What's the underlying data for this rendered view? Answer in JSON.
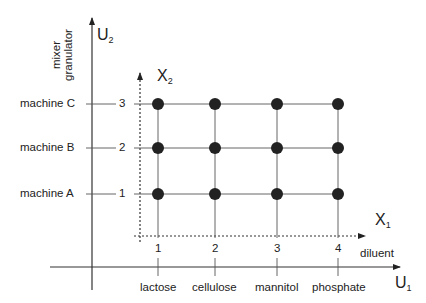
{
  "axes": {
    "u1": {
      "name": "U",
      "sub": "1"
    },
    "u2": {
      "name": "U",
      "sub": "2"
    },
    "x1": {
      "name": "X",
      "sub": "1"
    },
    "x2": {
      "name": "X",
      "sub": "2"
    }
  },
  "u2_title": {
    "line1": "mixer",
    "line2": "granulator"
  },
  "x1_title": "diluent",
  "rows": [
    {
      "label": "machine C",
      "level": "3"
    },
    {
      "label": "machine B",
      "level": "2"
    },
    {
      "label": "machine A",
      "level": "1"
    }
  ],
  "columns": [
    {
      "label": "lactose",
      "level": "1"
    },
    {
      "label": "cellulose",
      "level": "2"
    },
    {
      "label": "mannitol",
      "level": "3"
    },
    {
      "label": "phosphate",
      "level": "4"
    }
  ],
  "design_points": "4 x 3 full factorial grid (12 points)"
}
